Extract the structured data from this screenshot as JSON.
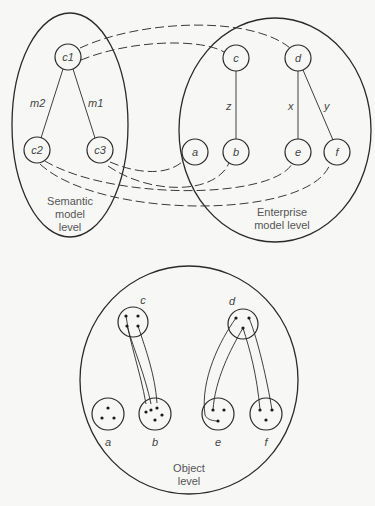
{
  "diagram": {
    "semantic_level": {
      "caption_lines": [
        "Semantic",
        "model",
        "level"
      ],
      "nodes": [
        {
          "id": "c1",
          "label": "c1"
        },
        {
          "id": "c2",
          "label": "c2"
        },
        {
          "id": "c3",
          "label": "c3"
        }
      ],
      "edges": [
        {
          "from": "c1",
          "to": "c2",
          "label": "m2"
        },
        {
          "from": "c1",
          "to": "c3",
          "label": "m1"
        }
      ]
    },
    "enterprise_level": {
      "caption_lines": [
        "Enterprise",
        "model level"
      ],
      "nodes": [
        {
          "id": "a",
          "label": "a"
        },
        {
          "id": "b",
          "label": "b"
        },
        {
          "id": "c",
          "label": "c"
        },
        {
          "id": "d",
          "label": "d"
        },
        {
          "id": "e",
          "label": "e"
        },
        {
          "id": "f",
          "label": "f"
        }
      ],
      "edges": [
        {
          "from": "c",
          "to": "b",
          "label": "z"
        },
        {
          "from": "d",
          "to": "e",
          "label": "x"
        },
        {
          "from": "d",
          "to": "f",
          "label": "y"
        }
      ]
    },
    "mappings": [
      {
        "from": "c1",
        "to": "d"
      },
      {
        "from": "c1",
        "to": "c"
      },
      {
        "from": "c3",
        "to": "a"
      },
      {
        "from": "c3",
        "to": "b"
      },
      {
        "from": "c2",
        "to": "e"
      },
      {
        "from": "c2",
        "to": "f"
      }
    ],
    "object_level": {
      "caption_lines": [
        "Object",
        "level"
      ],
      "sets": [
        {
          "id": "c",
          "label": "c",
          "instances": 4
        },
        {
          "id": "d",
          "label": "d",
          "instances": 3
        },
        {
          "id": "a",
          "label": "a",
          "instances": 3
        },
        {
          "id": "b",
          "label": "b",
          "instances": 5
        },
        {
          "id": "e",
          "label": "e",
          "instances": 3
        },
        {
          "id": "f",
          "label": "f",
          "instances": 3
        }
      ]
    }
  }
}
